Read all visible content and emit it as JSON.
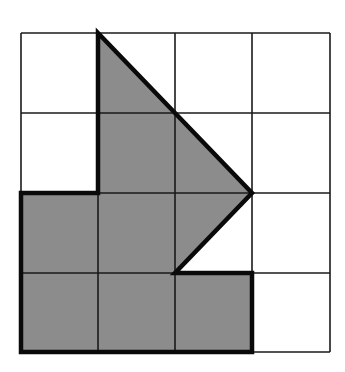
{
  "diagram": {
    "type": "grid-with-shaded-polygon",
    "grid": {
      "cols": 4,
      "rows": 4,
      "col_lines_px": [
        21,
        98,
        175,
        252,
        330
      ],
      "row_lines_px": [
        33,
        113,
        193,
        273,
        352
      ],
      "line_color": "#1a1a1a",
      "line_width": 1.6
    },
    "shape": {
      "description": "Shaded polygon outlined with thick border, vertices on grid points",
      "vertices_grid": [
        [
          1,
          0
        ],
        [
          3,
          2
        ],
        [
          2,
          3
        ],
        [
          3,
          3
        ],
        [
          3,
          4
        ],
        [
          0,
          4
        ],
        [
          0,
          2
        ],
        [
          1,
          2
        ]
      ],
      "fill": "#8c8c8c",
      "stroke": "#0a0a0a",
      "stroke_width": 4.5
    },
    "colors": {
      "background": "#ffffff"
    }
  }
}
